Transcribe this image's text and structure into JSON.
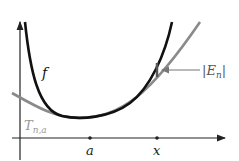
{
  "diagram": {
    "labels": {
      "f": "f",
      "taylor_main": "T",
      "taylor_sub": "n,a",
      "error_open": "|",
      "error_E": "E",
      "error_sub": "n",
      "error_close": "|",
      "point_a": "a",
      "point_x": "x"
    },
    "colors": {
      "function_curve": "#111111",
      "taylor_curve": "#8a8a8a",
      "axis": "#222222",
      "taylor_label": "#999999",
      "error_label": "#555555"
    }
  }
}
